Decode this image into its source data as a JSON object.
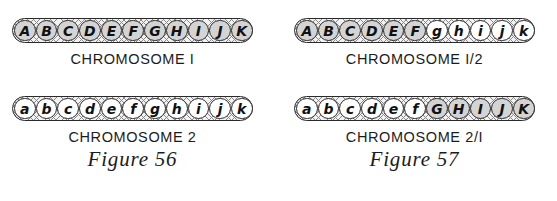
{
  "figures": [
    {
      "caption": "Figure 56",
      "chromosomes": [
        {
          "label": "CHROMOSOME I",
          "genes": [
            {
              "letter": "A",
              "shaded": true
            },
            {
              "letter": "B",
              "shaded": true
            },
            {
              "letter": "C",
              "shaded": true
            },
            {
              "letter": "D",
              "shaded": true
            },
            {
              "letter": "E",
              "shaded": true
            },
            {
              "letter": "F",
              "shaded": true
            },
            {
              "letter": "G",
              "shaded": true
            },
            {
              "letter": "H",
              "shaded": true
            },
            {
              "letter": "I",
              "shaded": true
            },
            {
              "letter": "J",
              "shaded": true
            },
            {
              "letter": "K",
              "shaded": true
            }
          ]
        },
        {
          "label": "CHROMOSOME 2",
          "genes": [
            {
              "letter": "a",
              "shaded": false
            },
            {
              "letter": "b",
              "shaded": false
            },
            {
              "letter": "c",
              "shaded": false
            },
            {
              "letter": "d",
              "shaded": false
            },
            {
              "letter": "e",
              "shaded": false
            },
            {
              "letter": "f",
              "shaded": false
            },
            {
              "letter": "g",
              "shaded": false
            },
            {
              "letter": "h",
              "shaded": false
            },
            {
              "letter": "i",
              "shaded": false
            },
            {
              "letter": "j",
              "shaded": false
            },
            {
              "letter": "k",
              "shaded": false
            }
          ]
        }
      ]
    },
    {
      "caption": "Figure 57",
      "chromosomes": [
        {
          "label": "CHROMOSOME I/2",
          "genes": [
            {
              "letter": "A",
              "shaded": true
            },
            {
              "letter": "B",
              "shaded": true
            },
            {
              "letter": "C",
              "shaded": true
            },
            {
              "letter": "D",
              "shaded": true
            },
            {
              "letter": "E",
              "shaded": true
            },
            {
              "letter": "F",
              "shaded": true
            },
            {
              "letter": "g",
              "shaded": false
            },
            {
              "letter": "h",
              "shaded": false
            },
            {
              "letter": "i",
              "shaded": false
            },
            {
              "letter": "j",
              "shaded": false
            },
            {
              "letter": "k",
              "shaded": false
            }
          ]
        },
        {
          "label": "CHROMOSOME 2/I",
          "genes": [
            {
              "letter": "a",
              "shaded": false
            },
            {
              "letter": "b",
              "shaded": false
            },
            {
              "letter": "c",
              "shaded": false
            },
            {
              "letter": "d",
              "shaded": false
            },
            {
              "letter": "e",
              "shaded": false
            },
            {
              "letter": "f",
              "shaded": false
            },
            {
              "letter": "G",
              "shaded": true
            },
            {
              "letter": "H",
              "shaded": true
            },
            {
              "letter": "I",
              "shaded": true
            },
            {
              "letter": "J",
              "shaded": true
            },
            {
              "letter": "K",
              "shaded": true
            }
          ]
        }
      ]
    }
  ],
  "colors": {
    "shaded_bead": "#d4d4d4",
    "plain_bead": "#ffffff",
    "outline": "#2a2a2a"
  }
}
